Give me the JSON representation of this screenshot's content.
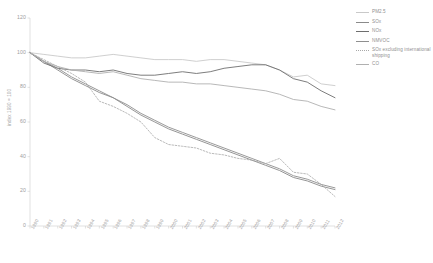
{
  "chart_data": {
    "type": "line",
    "title": "",
    "xlabel": "",
    "ylabel": "index 1990 = 100",
    "ylim": [
      0,
      120
    ],
    "yticks": [
      0,
      20,
      40,
      60,
      80,
      100,
      120
    ],
    "grid": false,
    "legend_position": "right",
    "x": [
      1990,
      1991,
      1992,
      1993,
      1994,
      1995,
      1996,
      1997,
      1998,
      1999,
      2000,
      2001,
      2002,
      2003,
      2004,
      2005,
      2006,
      2007,
      2008,
      2009,
      2010,
      2011,
      2012
    ],
    "categories": [
      "1990",
      "1991",
      "1992",
      "1993",
      "1994",
      "1995",
      "1996",
      "1997",
      "1998",
      "1999",
      "2000",
      "2001",
      "2002",
      "2003",
      "2004",
      "2005",
      "2006",
      "2007",
      "2008",
      "2009",
      "2010",
      "2011",
      "2012"
    ],
    "series": [
      {
        "name": "PM2.5",
        "style": "solid",
        "color": "#c9c9c9",
        "values": [
          100,
          99,
          98,
          97,
          97,
          98,
          99,
          98,
          97,
          96,
          96,
          96,
          95,
          96,
          96,
          95,
          94,
          93,
          90,
          86,
          87,
          82,
          81
        ]
      },
      {
        "name": "SOx",
        "style": "solid",
        "color": "#8a8a8a",
        "values": [
          100,
          95,
          90,
          85,
          81,
          77,
          74,
          69,
          64,
          60,
          56,
          53,
          50,
          47,
          44,
          41,
          38,
          35,
          32,
          28,
          26,
          23,
          21
        ]
      },
      {
        "name": "NOx",
        "style": "solid",
        "color": "#6e6e6e",
        "values": [
          100,
          94,
          91,
          90,
          90,
          89,
          90,
          88,
          87,
          87,
          88,
          89,
          88,
          89,
          91,
          92,
          93,
          93,
          90,
          85,
          83,
          78,
          74
        ]
      },
      {
        "name": "NMVOC",
        "style": "solid",
        "color": "#8f8f8f",
        "values": [
          100,
          95,
          91,
          86,
          82,
          78,
          74,
          70,
          65,
          61,
          57,
          54,
          51,
          48,
          45,
          42,
          39,
          36,
          33,
          29,
          27,
          24,
          22
        ]
      },
      {
        "name": "SOx excluding international shipping",
        "style": "dashed",
        "color": "#a8a8a8",
        "values": [
          100,
          96,
          92,
          88,
          83,
          72,
          69,
          65,
          60,
          51,
          47,
          46,
          45,
          42,
          41,
          39,
          38,
          36,
          39,
          31,
          30,
          24,
          17
        ]
      },
      {
        "name": "CO",
        "style": "solid",
        "color": "#b0b0b0",
        "values": [
          100,
          95,
          92,
          90,
          89,
          88,
          89,
          87,
          85,
          84,
          83,
          83,
          82,
          82,
          81,
          80,
          79,
          78,
          76,
          73,
          72,
          69,
          67
        ]
      }
    ]
  },
  "legend": {
    "items": [
      {
        "label": "PM2.5"
      },
      {
        "label": "SOx"
      },
      {
        "label": "NOx"
      },
      {
        "label": "NMVOC"
      },
      {
        "label": "SOx excluding international shipping"
      },
      {
        "label": "CO"
      }
    ]
  },
  "axes": {
    "y_title": "index 1990 = 100"
  }
}
